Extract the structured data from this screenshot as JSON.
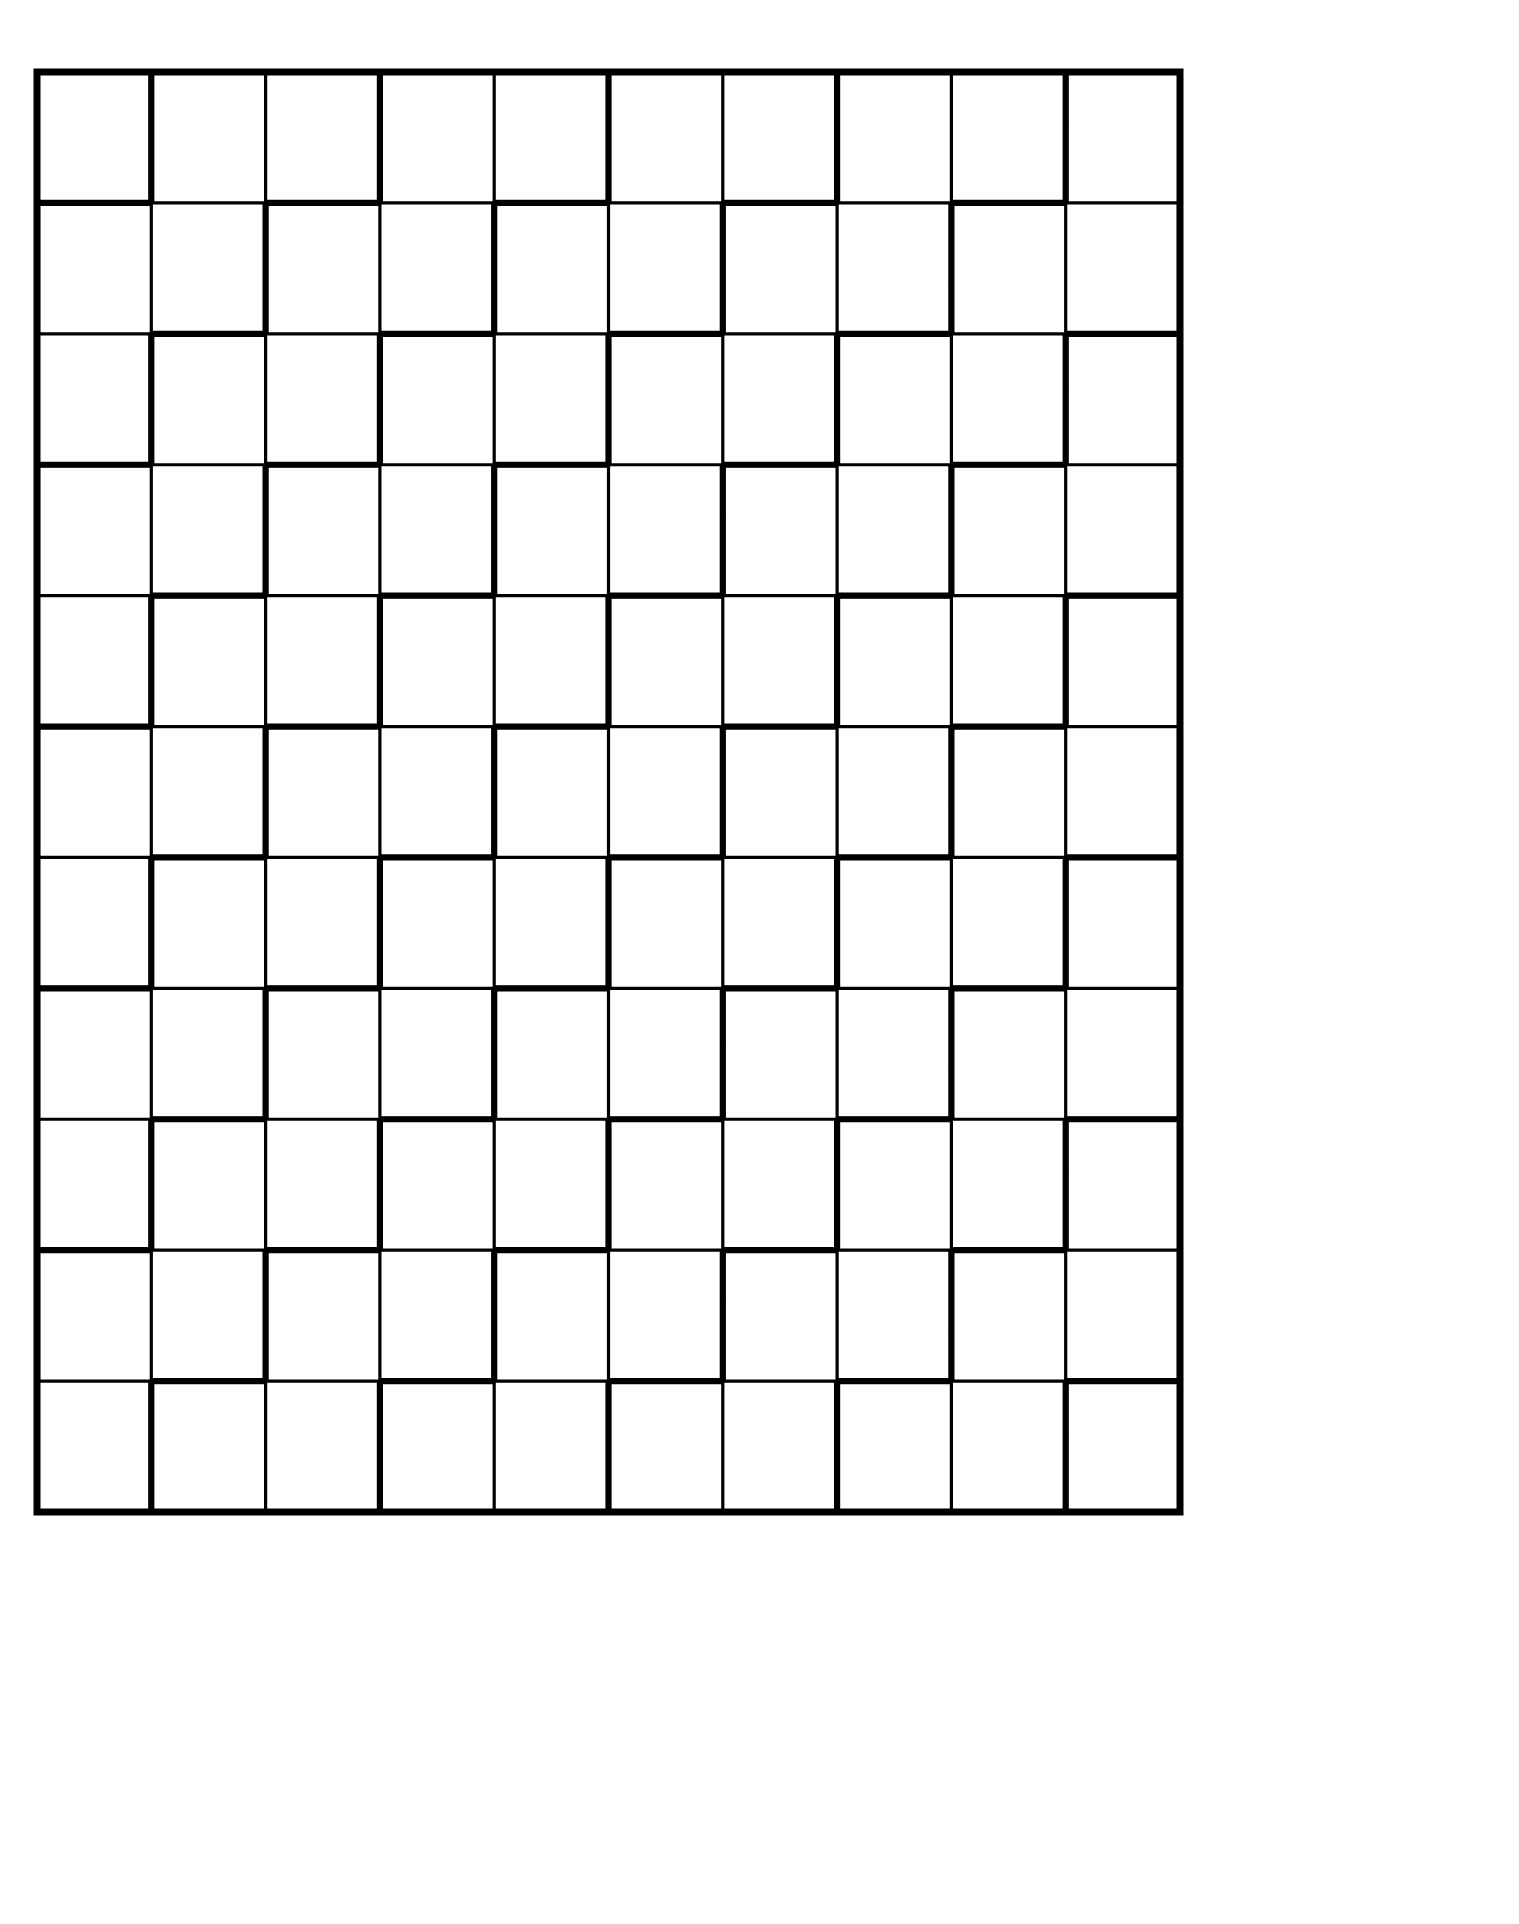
{
  "figure": {
    "canvas": {
      "width": 1519,
      "height": 1924,
      "background_color": "#ffffff"
    },
    "frame": {
      "name": "outer-border",
      "x": 37,
      "y": 72,
      "width": 1143,
      "height": 1440,
      "stroke_color": "#000000",
      "stroke_width": 7,
      "fill": "none"
    },
    "grid": {
      "columns": 10,
      "rows": 11,
      "cell_width": 114.3,
      "cell_height": 130.909,
      "gridline_color": "#000000",
      "gridline_width": 3.2
    },
    "fan_motif": {
      "name": "segmented-fan",
      "sweep_degrees": 270,
      "segments": 30,
      "segment_fill": "#d4d4d4",
      "hub_fill": "#f2f2f2",
      "stroke_color": "#000000",
      "stroke_width": 5.0,
      "inner_radius_ratio": 0.46,
      "outer_radius_ratio": 1.62,
      "hub_radius_ratio": 0.46
    },
    "palette": {
      "ink": "#000000",
      "paper": "#ffffff",
      "segment_gray": "#d4d4d4",
      "hub_gray": "#f2f2f2"
    },
    "layout_rule": {
      "description": "Fan centre corner alternates per cell. For cell (row r, column c) the centre is placed at the cell corner selected by the parity pair (r mod 2, c mod 2), and the 270-degree sweep opens away from that corner, so adjacent fans interlock.",
      "corner_cycle": [
        "bottom-right",
        "top-left",
        "bottom-right",
        "top-left"
      ]
    }
  },
  "chart_data": {
    "type": "diagram",
    "columns": 10,
    "rows": 11,
    "total_cells": 110,
    "segments_per_fan": 30,
    "fan_sweep_degrees": 270,
    "colors": [
      "#000000",
      "#ffffff",
      "#d4d4d4",
      "#f2f2f2"
    ]
  }
}
